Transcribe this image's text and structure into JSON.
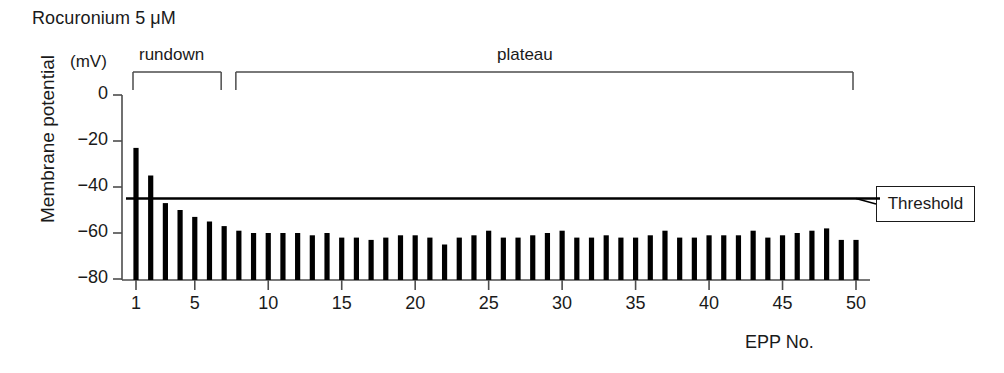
{
  "figure": {
    "drug_title": "Rocuronium 5 μM",
    "unit_label": "(mV)",
    "y_axis_title": "Membrane potential",
    "x_axis_title": "EPP No.",
    "threshold_label": "Threshold",
    "phase_brackets": [
      {
        "label": "rundown",
        "from_epp": 1,
        "to_epp": 7
      },
      {
        "label": "plateau",
        "from_epp": 8,
        "to_epp": 50
      }
    ],
    "colors": {
      "bar": "#000000",
      "axis": "#4d4d4d",
      "threshold_line": "#000000",
      "text": "#1a1a1a",
      "background": "#ffffff"
    }
  },
  "chart_data": {
    "type": "bar",
    "title": "Rocuronium 5 μM",
    "xlabel": "EPP No.",
    "ylabel": "Membrane potential",
    "yunit": "mV",
    "ylim": [
      -86,
      0
    ],
    "xlim": [
      0.2,
      50.8
    ],
    "grid": false,
    "legend": "none",
    "ytick_labels": [
      "0",
      "−20",
      "−40",
      "−60",
      "−80"
    ],
    "yticks": [
      0,
      -20,
      -40,
      -60,
      -80
    ],
    "xticks": [
      1,
      5,
      10,
      15,
      20,
      25,
      30,
      35,
      40,
      45,
      50
    ],
    "xtick_labels": [
      "1",
      "5",
      "10",
      "15",
      "20",
      "25",
      "30",
      "35",
      "40",
      "45",
      "50"
    ],
    "annotations": [
      {
        "name": "threshold-line",
        "type": "hline",
        "y": -45,
        "label": "Threshold"
      },
      {
        "name": "rundown-bracket",
        "type": "bracket",
        "label": "rundown",
        "x_from": 1,
        "x_to": 7
      },
      {
        "name": "plateau-bracket",
        "type": "bracket",
        "label": "plateau",
        "x_from": 8,
        "x_to": 50
      }
    ],
    "categories": [
      1,
      2,
      3,
      4,
      5,
      6,
      7,
      8,
      9,
      10,
      11,
      12,
      13,
      14,
      15,
      16,
      17,
      18,
      19,
      20,
      21,
      22,
      23,
      24,
      25,
      26,
      27,
      28,
      29,
      30,
      31,
      32,
      33,
      34,
      35,
      36,
      37,
      38,
      39,
      40,
      41,
      42,
      43,
      44,
      45,
      46,
      47,
      48,
      49,
      50
    ],
    "values": [
      -23,
      -35,
      -47,
      -50,
      -53,
      -55,
      -57,
      -59,
      -60,
      -60,
      -60,
      -60,
      -61,
      -60,
      -62,
      -62,
      -63,
      -62,
      -61,
      -61,
      -62,
      -65,
      -62,
      -61,
      -59,
      -62,
      -62,
      -61,
      -60,
      -59,
      -62,
      -62,
      -61,
      -62,
      -62,
      -61,
      -59,
      -62,
      -62,
      -61,
      -61,
      -61,
      -59,
      -62,
      -61,
      -60,
      -59,
      -58,
      -63,
      -63
    ]
  }
}
